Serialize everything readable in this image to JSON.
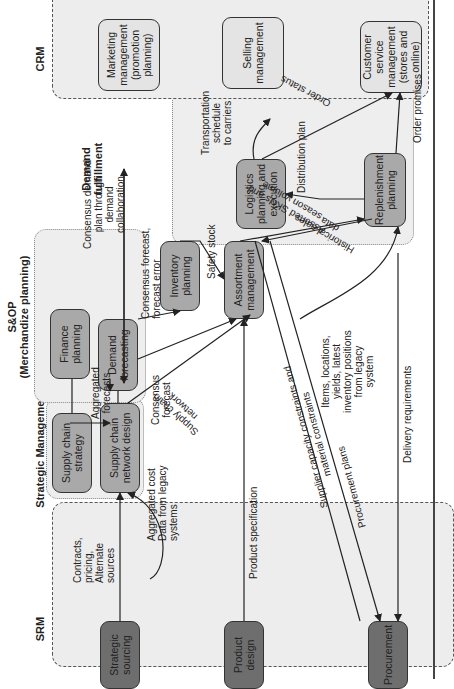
{
  "zones": {
    "srm": {
      "title": "SRM"
    },
    "strategic": {
      "title": "Strategic Management"
    },
    "sop": {
      "title": "S&OP\n(Merchandize planning)",
      "title_line1": "S&OP",
      "title_line2": "(Merchandize planning)"
    },
    "demand_fulfillment": {
      "title_line1": "Demand",
      "title_line2": "fulfillment"
    },
    "crm": {
      "title": "CRM"
    }
  },
  "boxes": {
    "strategic_sourcing": "Strategic sourcing",
    "product_design": "Product design",
    "procurement": "Procurement",
    "supply_chain_strategy": "Supply chain strategy",
    "supply_chain_network_design": "Supply chain network design",
    "finance_planning": "Finance planning",
    "demand_forecasting": "Demand forecasting",
    "inventory_planning": "Inventory planning",
    "assortment_management": "Assortment management",
    "logistics_planning": "Logistics planning and execution",
    "replenishment_planning": "Replenishment planning",
    "marketing_management": "Marketing management (promotion planning)",
    "selling_management": "Selling management",
    "customer_service_management": "Customer service management (stores and online)"
  },
  "flows": {
    "contracts": [
      "Contracts,",
      "pricing,",
      "Alternate",
      "sources"
    ],
    "aggregated_cost": [
      "Aggregated cost",
      "Data from legacy",
      "systems"
    ],
    "aggregated_forecasts": [
      "Aggregated",
      "forecasts"
    ],
    "consensus_forecast": [
      "Consensus",
      "forecast"
    ],
    "supply_chain_network": [
      "Supply chain",
      "network"
    ],
    "product_specification": "Product specification",
    "supplier_capacity": [
      "Supplier capacity constraints and",
      "material constraints"
    ],
    "procurement_plans": "Procurement plans",
    "consensus_demand_plan": [
      "Consensus demand",
      "plan through",
      "demand",
      "collaboration"
    ],
    "consensus_forecast_error": [
      "Consensus forecast,",
      "forecast error"
    ],
    "safety_stock": "Safety stock",
    "assorted_skus": [
      "Assorted SKUs and",
      "season volume"
    ],
    "historical_sales": [
      "Historical sales",
      "data"
    ],
    "items_locations": [
      "Items, locations,",
      "yields, latest",
      "inventory positions",
      "from legacy",
      "system"
    ],
    "delivery_requirements": "Delivery requirements",
    "distribution_plan": "Distribution plan",
    "transportation_schedule": [
      "Transportation",
      "schedule",
      "to carriers"
    ],
    "order_status": "Order status",
    "order_promises": "Order promises"
  },
  "colors": {
    "zone_fill": "#ededed",
    "box_light": "#e4e4e4",
    "box_mid": "#a9a9a9",
    "box_dark": "#6e6e6e",
    "line": "#222222"
  }
}
